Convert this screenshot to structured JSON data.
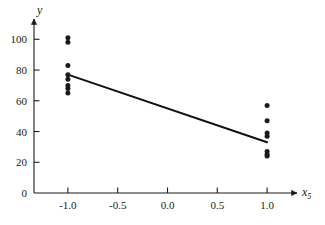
{
  "chart_data": {
    "type": "scatter",
    "title": "",
    "subtitle": "",
    "xlabel": "x5",
    "ylabel": "y",
    "xlim": [
      -1.25,
      1.25
    ],
    "ylim": [
      0,
      108
    ],
    "grid": false,
    "legend": null,
    "xticks": [
      -1.0,
      -0.5,
      0.0,
      0.5,
      1.0
    ],
    "xtick_labels": [
      "-1.0",
      "-0.5",
      "0.0",
      "0.5",
      "1.0"
    ],
    "yticks": [
      0,
      20,
      40,
      60,
      80,
      100
    ],
    "ytick_labels": [
      "0",
      "20",
      "40",
      "60",
      "80",
      "100"
    ],
    "series": [
      {
        "name": "observations",
        "type": "scatter",
        "marker": "circle",
        "color": "#1a1a1a",
        "points": [
          {
            "x": -1.0,
            "y": 101
          },
          {
            "x": -1.0,
            "y": 98
          },
          {
            "x": -1.0,
            "y": 83
          },
          {
            "x": -1.0,
            "y": 77
          },
          {
            "x": -1.0,
            "y": 74
          },
          {
            "x": -1.0,
            "y": 70
          },
          {
            "x": -1.0,
            "y": 68
          },
          {
            "x": -1.0,
            "y": 65
          },
          {
            "x": 1.0,
            "y": 57
          },
          {
            "x": 1.0,
            "y": 47
          },
          {
            "x": 1.0,
            "y": 39
          },
          {
            "x": 1.0,
            "y": 37
          },
          {
            "x": 1.0,
            "y": 27
          },
          {
            "x": 1.0,
            "y": 25
          },
          {
            "x": 1.0,
            "y": 24
          }
        ]
      },
      {
        "name": "fitted-line",
        "type": "line",
        "color": "#111111",
        "points": [
          {
            "x": -1.0,
            "y": 77
          },
          {
            "x": 1.0,
            "y": 33
          }
        ]
      }
    ]
  },
  "axes": {
    "x_axis_label": "x",
    "x_axis_subscript": "5",
    "y_axis_label": "y"
  },
  "colors": {
    "axis": "#1a1a1a",
    "marker": "#1a1a1a",
    "line": "#111111",
    "background": "#ffffff"
  }
}
